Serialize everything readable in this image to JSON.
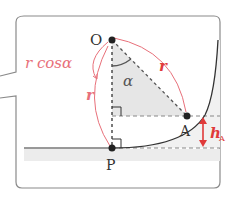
{
  "diagram": {
    "points": {
      "O": "O",
      "A": "A",
      "P": "P"
    },
    "labels": {
      "r_cos_alpha": "r cosα",
      "r_left": "r",
      "r_right": "r",
      "alpha": "α",
      "h_main": "h",
      "h_sub": "A"
    },
    "colors": {
      "accent_red": "#e03a3a",
      "label_pink": "#e8707a",
      "line_dark": "#333333",
      "shade_gray": "#ececec",
      "dash_gray": "#888888",
      "frame_gray": "#8a8a8a"
    }
  }
}
